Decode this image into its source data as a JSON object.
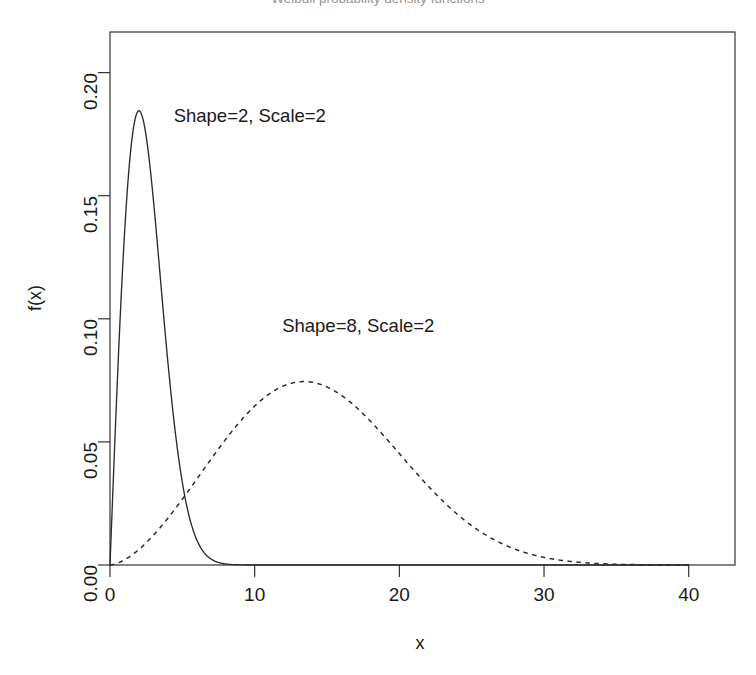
{
  "chart_data": {
    "type": "line",
    "title": "Weibull probability density functions",
    "xlabel": "x",
    "ylabel": "f(x)",
    "xlim": [
      0,
      43.2
    ],
    "ylim": [
      0,
      0.2165
    ],
    "xticks": [
      0,
      10,
      20,
      30,
      40
    ],
    "xticklabels": [
      "0",
      "10",
      "20",
      "30",
      "40"
    ],
    "yticks": [
      0.0,
      0.05,
      0.1,
      0.15,
      0.2
    ],
    "yticklabels": [
      "0.00",
      "0.05",
      "0.10",
      "0.15",
      "0.20"
    ],
    "grid": false,
    "legend_position": "inline-annotations",
    "distribution": "weibull",
    "series": [
      {
        "name": "Shape=2, Scale=2",
        "label": "Shape=2, Scale=2",
        "linestyle": "solid",
        "color": "#2b2b2b",
        "shape": 2,
        "scale": 2,
        "render_scale": 2.83,
        "peak_x": 2.0,
        "peak_y": 0.1845,
        "annotation": {
          "text": "Shape=2, Scale=2",
          "x": 4.4,
          "y": 0.182
        },
        "x": [
          0,
          0.5,
          1,
          1.5,
          2,
          2.5,
          3,
          4,
          5,
          6,
          7,
          8,
          9,
          10,
          12,
          14,
          16,
          18,
          20,
          24,
          28,
          32,
          36,
          40
        ],
        "y": [
          0.0,
          0.0595,
          0.1072,
          0.1447,
          0.1675,
          0.1776,
          0.1776,
          0.1552,
          0.1201,
          0.0851,
          0.0556,
          0.0337,
          0.0189,
          0.0098,
          0.0021,
          0.0003,
          4e-05,
          0.0,
          0.0,
          0.0,
          0.0,
          0.0,
          0.0,
          0.0
        ]
      },
      {
        "name": "Shape=8, Scale=2",
        "label": "Shape=8, Scale=2",
        "linestyle": "dashed",
        "color": "#2b2b2b",
        "shape": 8,
        "scale": 2,
        "render_shape": 2.62,
        "render_scale": 16.1,
        "peak_x": 14.0,
        "peak_y": 0.0745,
        "annotation": {
          "text": "Shape=8, Scale=2",
          "x": 11.9,
          "y": 0.0965
        },
        "x": [
          0,
          2,
          4,
          6,
          8,
          10,
          12,
          14,
          16,
          18,
          20,
          22,
          24,
          26,
          28,
          30,
          32,
          34,
          36,
          38,
          40
        ],
        "y": [
          0.0,
          0.0016,
          0.0081,
          0.0203,
          0.0372,
          0.0552,
          0.0692,
          0.0745,
          0.071,
          0.0612,
          0.0483,
          0.0351,
          0.0236,
          0.0148,
          0.0086,
          0.0047,
          0.0024,
          0.0011,
          0.0005,
          0.0002,
          0.0001
        ]
      }
    ],
    "crossing_point": {
      "x": 8.2,
      "y": 0.029
    }
  }
}
